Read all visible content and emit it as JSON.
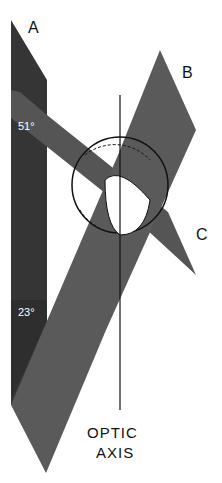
{
  "figure": {
    "labels": {
      "plate_a": "A",
      "plate_b": "B",
      "plate_c": "C",
      "axis_line1": "OPTIC",
      "axis_line2": "AXIS"
    },
    "angles": {
      "upper": "51°",
      "lower": "23°"
    },
    "colors": {
      "plate_dark": "#3a3a3a",
      "plate_mid": "#555555",
      "plate_light": "#606060",
      "background": "#ffffff",
      "line": "#111111"
    }
  }
}
